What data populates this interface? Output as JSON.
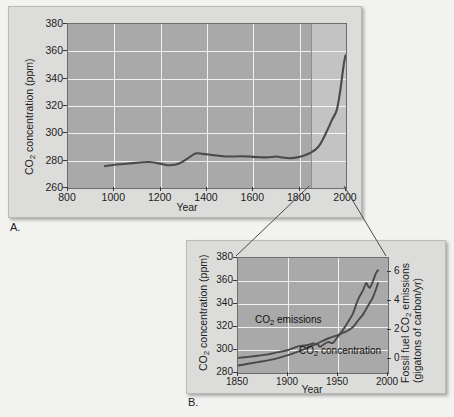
{
  "figure": {
    "panel_a_letter": "A.",
    "panel_b_letter": "B."
  },
  "chart_data": [
    {
      "id": "panel_a",
      "type": "line",
      "title": "",
      "xlabel": "Year",
      "ylabel": "CO2 concentration (ppm)",
      "ylabel_display": "CO",
      "ylabel_sub": "2",
      "ylabel_rest": " concentration (ppm)",
      "xlim": [
        800,
        2000
      ],
      "ylim": [
        260,
        380
      ],
      "xticks": [
        800,
        1000,
        1200,
        1400,
        1600,
        1800,
        2000
      ],
      "yticks": [
        260,
        280,
        300,
        320,
        340,
        360,
        380
      ],
      "grid": true,
      "highlight_region": [
        1850,
        2000
      ],
      "series": [
        {
          "name": "CO2 concentration",
          "x": [
            960,
            1000,
            1040,
            1080,
            1120,
            1150,
            1180,
            1210,
            1240,
            1280,
            1320,
            1350,
            1380,
            1420,
            1460,
            1500,
            1540,
            1580,
            1620,
            1660,
            1700,
            1730,
            1760,
            1790,
            1820,
            1850,
            1880,
            1900,
            1920,
            1940,
            1960,
            1975,
            1990,
            1998
          ],
          "values": [
            276.0,
            277.0,
            277.6,
            278.2,
            278.8,
            279.0,
            278.4,
            277.4,
            276.6,
            278.0,
            282.0,
            285.2,
            285.0,
            284.2,
            283.4,
            283.0,
            283.2,
            283.0,
            282.6,
            282.4,
            283.0,
            282.2,
            281.8,
            282.4,
            283.8,
            286.0,
            290.0,
            295.5,
            302.5,
            310.0,
            317.0,
            331.0,
            350.0,
            357.0
          ]
        }
      ]
    },
    {
      "id": "panel_b",
      "type": "line",
      "title": "",
      "xlabel": "Year",
      "ylabel_left": "CO2 concentration (ppm)",
      "ylabel_left_display": "CO",
      "ylabel_left_sub": "2",
      "ylabel_left_rest": " concentration (ppm)",
      "ylabel_right_line1": "Fossil fuel CO2 emissions",
      "ylabel_right_line1_display": "Fossil fuel CO",
      "ylabel_right_sub": "2",
      "ylabel_right_line1_rest": " emissions",
      "ylabel_right_line2": "(gigatons of carbon/yr)",
      "xlim": [
        1850,
        2000
      ],
      "ylim_left": [
        280,
        380
      ],
      "ylim_right": [
        -1,
        7
      ],
      "xticks": [
        1850,
        1900,
        1950,
        2000
      ],
      "yticks_left": [
        280,
        300,
        320,
        340,
        360,
        380
      ],
      "yticks_right": [
        0,
        2,
        4,
        6
      ],
      "grid": true,
      "annotations": [
        {
          "text": "CO2 emissions",
          "display": "CO",
          "sub": "2",
          "rest": " emissions",
          "x": 1868,
          "y_left": 325
        },
        {
          "text": "CO2 concentration",
          "display": "CO",
          "sub": "2",
          "rest": " concentration",
          "x": 1912,
          "y_left": 298
        }
      ],
      "series": [
        {
          "name": "CO2 concentration",
          "axis": "left",
          "units": "ppm",
          "x": [
            1850,
            1860,
            1870,
            1880,
            1890,
            1900,
            1910,
            1920,
            1930,
            1940,
            1950,
            1955,
            1960,
            1965,
            1970,
            1975,
            1980,
            1985,
            1990
          ],
          "values": [
            286.5,
            288.0,
            289.5,
            291.0,
            293.0,
            295.5,
            298.5,
            302.0,
            306.0,
            310.0,
            313.0,
            315.0,
            317.0,
            320.0,
            325.5,
            331.0,
            338.5,
            346.0,
            358.0
          ]
        },
        {
          "name": "Fossil fuel CO2 emissions",
          "axis": "right",
          "units": "gigatons of carbon/yr",
          "x": [
            1850,
            1860,
            1870,
            1880,
            1890,
            1900,
            1910,
            1920,
            1925,
            1930,
            1932,
            1935,
            1940,
            1945,
            1950,
            1955,
            1960,
            1965,
            1970,
            1975,
            1978,
            1980,
            1982,
            1985,
            1988,
            1990
          ],
          "values": [
            0.05,
            0.12,
            0.2,
            0.3,
            0.45,
            0.6,
            0.85,
            0.95,
            1.05,
            0.95,
            0.82,
            0.95,
            1.15,
            1.1,
            1.55,
            2.0,
            2.55,
            3.15,
            4.1,
            4.75,
            5.25,
            5.05,
            4.95,
            5.4,
            5.95,
            6.15
          ]
        }
      ]
    }
  ],
  "connectors": [
    {
      "from": "panel_a_highlight_bottom_left",
      "to": "panel_b_top_left"
    },
    {
      "from": "panel_a_highlight_bottom_right",
      "to": "panel_b_top_right"
    }
  ]
}
